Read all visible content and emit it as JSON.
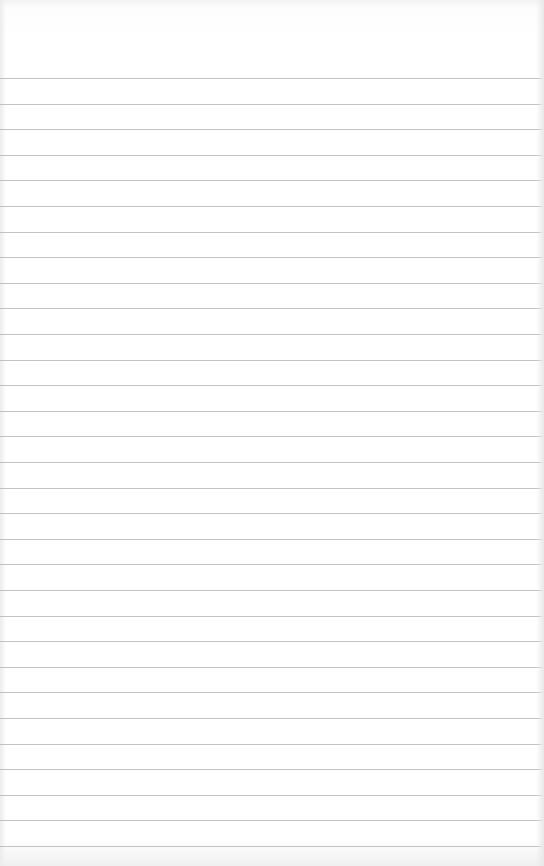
{
  "page": {
    "background_color": "#ffffff",
    "rule_color": "#b9b9b9",
    "rule_count": 31,
    "first_rule_y": 78,
    "rule_spacing": 25.6
  }
}
